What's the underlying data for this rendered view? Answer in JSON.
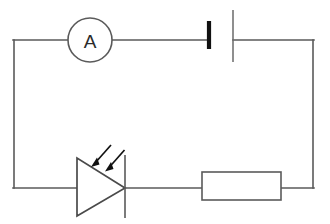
{
  "diagram": {
    "type": "electrical-circuit-schematic",
    "background_color": "#ffffff",
    "line_color": "#5a5a5a",
    "accent_color": "#111111",
    "canvas": {
      "width": 330,
      "height": 224
    }
  },
  "components": {
    "ammeter": {
      "label": "A",
      "name": "ammeter",
      "shape": "circle",
      "center_x": 90,
      "center_y": 40,
      "radius": 22
    },
    "cell": {
      "name": "cell-battery",
      "negative_plate": {
        "x": 209,
        "y_top": 20,
        "y_bottom": 50,
        "style": "short-thick"
      },
      "positive_plate": {
        "x": 233,
        "y_top": 10,
        "y_bottom": 62,
        "style": "long-thin"
      }
    },
    "photodiode": {
      "name": "photodiode",
      "triangle": {
        "left_x": 77,
        "top_y": 158,
        "bottom_y": 216,
        "apex_x": 125,
        "apex_y": 188
      },
      "cathode_bar": {
        "x": 125,
        "y_top": 155,
        "y_bottom": 218
      },
      "light_arrows": [
        {
          "x1": 111,
          "y1": 145,
          "x2": 92,
          "y2": 166
        },
        {
          "x1": 124,
          "y1": 150,
          "x2": 106,
          "y2": 171
        }
      ]
    },
    "resistor": {
      "name": "resistor",
      "x": 202,
      "y": 172,
      "width": 79,
      "height": 28
    }
  },
  "wires": {
    "top_rail_y": 40,
    "bottom_rail_y": 188,
    "left_rail_x": 14,
    "right_rail_x": 313,
    "segments": [
      {
        "name": "left-rail",
        "x1": 14,
        "y1": 40,
        "x2": 14,
        "y2": 188
      },
      {
        "name": "top-left-to-ammeter",
        "x1": 14,
        "y1": 40,
        "x2": 68,
        "y2": 40
      },
      {
        "name": "ammeter-to-cell",
        "x1": 112,
        "y1": 40,
        "x2": 209,
        "y2": 40
      },
      {
        "name": "cell-to-top-right",
        "x1": 233,
        "y1": 40,
        "x2": 313,
        "y2": 40
      },
      {
        "name": "right-rail",
        "x1": 313,
        "y1": 40,
        "x2": 313,
        "y2": 188
      },
      {
        "name": "bottom-left-to-diode",
        "x1": 14,
        "y1": 188,
        "x2": 77,
        "y2": 188
      },
      {
        "name": "diode-to-resistor",
        "x1": 125,
        "y1": 188,
        "x2": 202,
        "y2": 188
      },
      {
        "name": "resistor-to-bottom-right",
        "x1": 281,
        "y1": 188,
        "x2": 313,
        "y2": 188
      }
    ]
  }
}
